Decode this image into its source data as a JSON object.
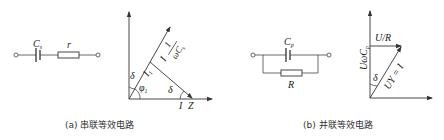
{
  "panel_a": {
    "circuit": {
      "capacitor_label": "C",
      "capacitor_sub": "s",
      "resistor_label": "r"
    },
    "phasor": {
      "angle_top": "δ",
      "angle_phi": "φ",
      "angle_phi_sub": "1",
      "current_label": "I",
      "current_sub": "1",
      "fraction_prefix": "I",
      "fraction_num": "1",
      "fraction_den": "ωC",
      "fraction_den_sub": "s",
      "angle_bottom": "δ",
      "x_label_i": "I",
      "x_label_z": "Z"
    },
    "caption": "(a)  串联等效电路"
  },
  "panel_b": {
    "circuit": {
      "capacitor_label": "C",
      "capacitor_sub": "p",
      "resistor_label": "R"
    },
    "phasor": {
      "horizontal_label": "U/R",
      "vertical_label": "UωC",
      "vertical_sub": "p",
      "diagonal_label": "UY = I",
      "angle_label": "δ"
    },
    "caption": "(b)  并联等效电路"
  },
  "colors": {
    "line": "#333333",
    "text": "#222222"
  }
}
